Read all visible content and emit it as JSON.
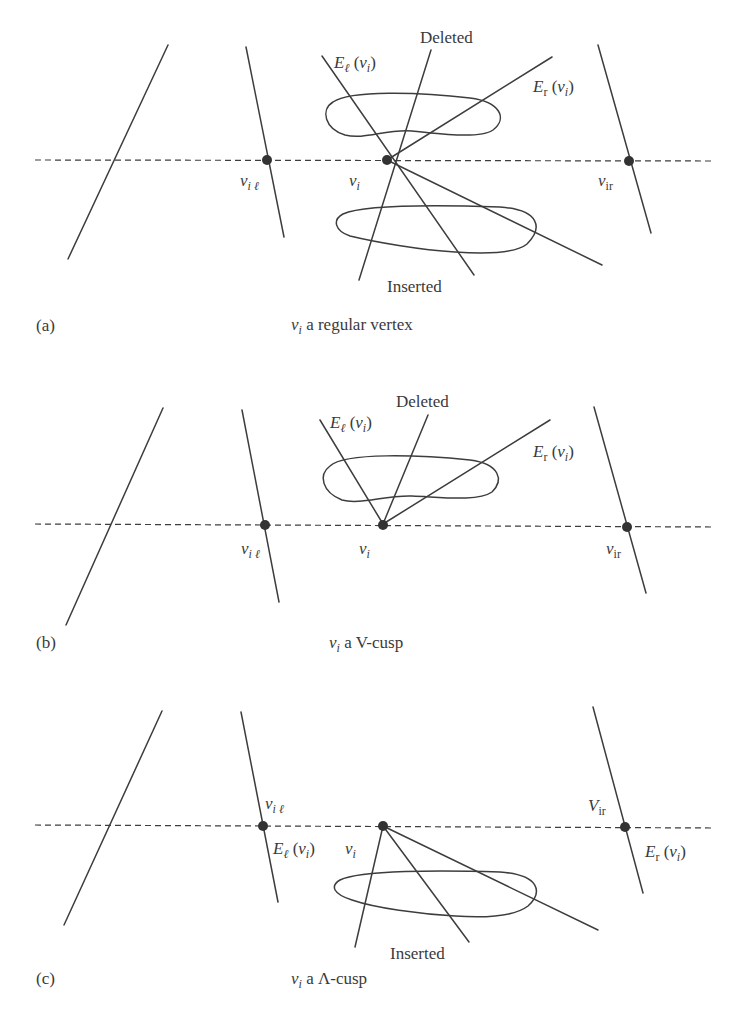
{
  "figure": {
    "panels": [
      {
        "id": "a",
        "panel_label": "(a)",
        "caption_var": "ν",
        "caption_sub": "i",
        "caption_text": " a regular vertex",
        "deleted_label": "Deleted",
        "inserted_label": "Inserted",
        "el_label": {
          "E": "E",
          "sub": "ℓ",
          "arg_open": " (",
          "v": "ν",
          "v_sub": "i",
          "arg_close": ")"
        },
        "er_label": {
          "E": "E",
          "sub": "r",
          "arg_open": " (",
          "v": "ν",
          "v_sub": "i",
          "arg_close": ")"
        },
        "vil_label": {
          "v": "ν",
          "sub": "i ℓ"
        },
        "vi_label": {
          "v": "ν",
          "sub": "i"
        },
        "vir_label": {
          "v": "ν",
          "sub": "ir"
        }
      },
      {
        "id": "b",
        "panel_label": "(b)",
        "caption_var": "ν",
        "caption_sub": "i",
        "caption_text": " a V-cusp",
        "deleted_label": "Deleted",
        "el_label": {
          "E": "E",
          "sub": "ℓ",
          "arg_open": " (",
          "v": "ν",
          "v_sub": "i",
          "arg_close": ")"
        },
        "er_label": {
          "E": "E",
          "sub": "r",
          "arg_open": " (",
          "v": "ν",
          "v_sub": "i",
          "arg_close": ")"
        },
        "vil_label": {
          "v": "ν",
          "sub": "i ℓ"
        },
        "vi_label": {
          "v": "ν",
          "sub": "i"
        },
        "vir_label": {
          "v": "ν",
          "sub": "ir"
        }
      },
      {
        "id": "c",
        "panel_label": "(c)",
        "caption_var": "ν",
        "caption_sub": "i",
        "caption_text": " a Λ-cusp",
        "inserted_label": "Inserted",
        "el_label": {
          "E": "E",
          "sub": "ℓ",
          "arg_open": " (",
          "v": "ν",
          "v_sub": "i",
          "arg_close": ")"
        },
        "er_label": {
          "E": "E",
          "sub": "r",
          "arg_open": " (",
          "v": "ν",
          "v_sub": "i",
          "arg_close": ")"
        },
        "vil_label": {
          "v": "ν",
          "sub": "i ℓ"
        },
        "vi_label": {
          "v": "ν",
          "sub": "i"
        },
        "vir_label": {
          "v": "V",
          "sub": "ir"
        }
      }
    ],
    "colors": {
      "stroke": "#3d3d3d",
      "text": "#3a3a3a",
      "background": "#ffffff"
    }
  }
}
